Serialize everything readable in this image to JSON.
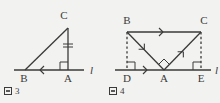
{
  "figures": [
    {
      "id": "fig3",
      "caption_prefix": "图",
      "caption_number": "3",
      "caption_text": "图 3",
      "line_label": "l",
      "vertices": [
        {
          "name": "C",
          "label": "C",
          "x": 68,
          "y": 28
        },
        {
          "name": "B",
          "label": "B",
          "x": 25,
          "y": 70
        },
        {
          "name": "A",
          "label": "A",
          "x": 68,
          "y": 70
        }
      ],
      "segments": [
        {
          "name": "hypotenuse-BC",
          "from": "B",
          "to": "C",
          "style": "solid"
        },
        {
          "name": "leg-CA",
          "from": "C",
          "to": "A",
          "style": "solid",
          "tick": "double"
        },
        {
          "name": "base-BA",
          "from": "B",
          "to": "A",
          "style": "solid",
          "tick": "arrow-left"
        }
      ],
      "right_angles": [
        {
          "name": "right-angle-at-A",
          "at": "A"
        }
      ],
      "axis": {
        "name": "line-l",
        "x1": 14,
        "x2": 84,
        "y": 70
      }
    },
    {
      "id": "fig4",
      "caption_prefix": "图",
      "caption_number": "4",
      "caption_text": "图 4",
      "line_label": "l",
      "vertices": [
        {
          "name": "B",
          "label": "B",
          "x": 22,
          "y": 32
        },
        {
          "name": "C",
          "label": "C",
          "x": 96,
          "y": 32
        },
        {
          "name": "D",
          "label": "D",
          "x": 22,
          "y": 70
        },
        {
          "name": "A",
          "label": "A",
          "x": 59,
          "y": 70
        },
        {
          "name": "E",
          "label": "E",
          "x": 96,
          "y": 70
        }
      ],
      "segments": [
        {
          "name": "top-BC",
          "from": "B",
          "to": "C",
          "style": "solid",
          "marker": "arrow-right"
        },
        {
          "name": "side-BA",
          "from": "B",
          "to": "A",
          "style": "solid",
          "marker": "arrow-down"
        },
        {
          "name": "side-AC",
          "from": "A",
          "to": "C",
          "style": "solid",
          "marker": "arrow-up"
        },
        {
          "name": "perp-BD",
          "from": "B",
          "to": "D",
          "style": "dashed"
        },
        {
          "name": "perp-CE",
          "from": "C",
          "to": "E",
          "style": "dashed"
        },
        {
          "name": "base-DA",
          "from": "D",
          "to": "A",
          "style": "solid",
          "marker": "arrow-right"
        }
      ],
      "right_angles": [
        {
          "name": "right-angle-at-D",
          "at": "D"
        },
        {
          "name": "right-angle-at-A",
          "at": "A"
        },
        {
          "name": "right-angle-at-E",
          "at": "E"
        }
      ],
      "axis": {
        "name": "line-l",
        "x1": 10,
        "x2": 106,
        "y": 70
      }
    }
  ],
  "colors": {
    "background": "#f2f2f0",
    "stroke": "#3a3a3a",
    "text": "#3a3a3a"
  }
}
